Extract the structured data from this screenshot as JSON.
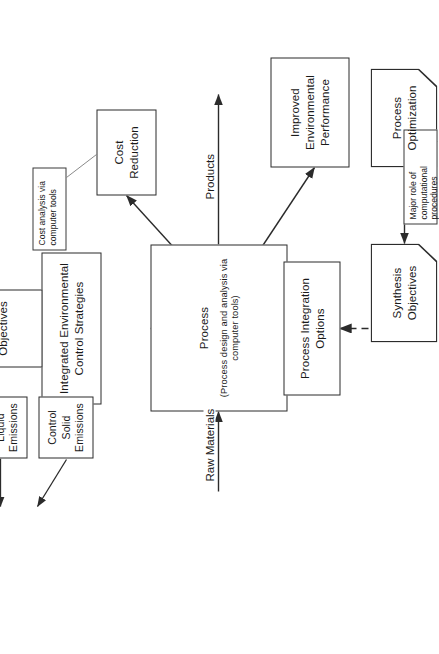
{
  "diagram": {
    "type": "process-flow",
    "orientation": "rotated-90-ccw",
    "nodes": {
      "process": {
        "title": "Process",
        "subtitle": "(Process design and analysis via computer tools)"
      },
      "integrated_strategies": {
        "label": "Integrated Environmental Control Strategies"
      },
      "environmental_objectives": {
        "label": "Environmental Objectives"
      },
      "control_solid": {
        "label": "Control Solid Emissions"
      },
      "control_liquid": {
        "label": "Control Liquid Emissions"
      },
      "control_gaseous": {
        "label": "Control Gaseous Emissions"
      },
      "cost_reduction": {
        "label": "Cost Reduction"
      },
      "improved_performance": {
        "label": "Improved Environmental Performance"
      },
      "process_integration": {
        "label": "Process Integration Options"
      },
      "synthesis_objectives": {
        "label": "Synthesis Objectives"
      },
      "process_optimization": {
        "label": "Process Optimization"
      }
    },
    "callouts": {
      "cost_analysis": {
        "text": "Cost analysis via computer tools"
      },
      "major_role": {
        "text": "Major role of computational procedures"
      }
    },
    "flow_labels": {
      "raw_materials": "Raw Materials",
      "products": "Products"
    }
  },
  "colors": {
    "stroke": "#2b2b2b",
    "background": "#ffffff",
    "text": "#1a1a1a"
  }
}
